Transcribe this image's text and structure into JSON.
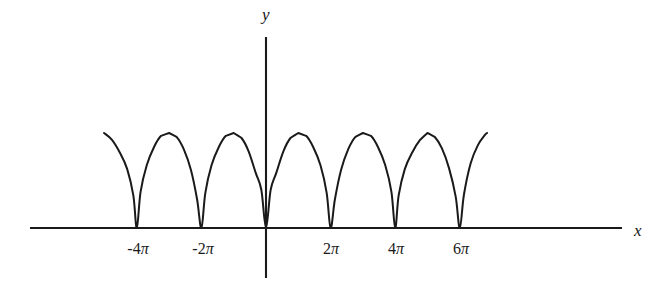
{
  "figure": {
    "background_color": "#ffffff",
    "curve_color": "#1a1a1a",
    "axis_color": "#1a1a1a",
    "width": 659,
    "height": 290
  },
  "axes": {
    "x_label": "x",
    "y_label": "y",
    "x_axis_pixel_y": 228,
    "y_axis_pixel_x": 266,
    "x_axis_start_px": 30,
    "x_axis_end_px": 622,
    "y_axis_top_px": 37,
    "y_axis_bottom_px": 278
  },
  "ticks": {
    "x": [
      {
        "label_num": "-4",
        "label_sym": "π",
        "value": -12.566370614,
        "pixel_x": 138
      },
      {
        "label_num": "-2",
        "label_sym": "π",
        "value": -6.283185307,
        "pixel_x": 203
      },
      {
        "label_num": "2",
        "label_sym": "π",
        "value": 6.283185307,
        "pixel_x": 331
      },
      {
        "label_num": "4",
        "label_sym": "π",
        "value": 12.566370614,
        "pixel_x": 396
      },
      {
        "label_num": "6",
        "label_sym": "π",
        "value": 18.849555922,
        "pixel_x": 461
      }
    ]
  },
  "chart_data": {
    "type": "line",
    "title": "",
    "xlabel": "x",
    "ylabel": "y",
    "grid": false,
    "legend": null,
    "function_description": "Periodic non-negative cusped wave: y = A*sqrt(|sin(x/2)|), period 2π, zeros at even multiples of π, sharp cusp maxima at odd multiples of π",
    "period": 6.283185307,
    "amplitude": 1.0,
    "xlim": [
      -16.0,
      21.5
    ],
    "ylim": [
      0,
      1.15
    ],
    "zeros": [
      -12.566370614,
      -6.283185307,
      0,
      6.283185307,
      12.566370614,
      18.849555922,
      25.132741229
    ],
    "peaks_x": [
      -15.707963268,
      -9.424777961,
      -3.141592654,
      3.141592654,
      9.424777961,
      15.707963268,
      21.991148575
    ],
    "peak_value": 1.0,
    "x": [
      -15.75,
      -15.0,
      -14.25,
      -13.5,
      -12.9,
      -12.566370614,
      -12.2,
      -11.6,
      -10.9,
      -10.2,
      -9.424777961,
      -8.7,
      -8.0,
      -7.3,
      -6.7,
      -6.283185307,
      -5.9,
      -5.3,
      -4.6,
      -3.9,
      -3.141592654,
      -2.4,
      -1.7,
      -1.0,
      -0.45,
      0,
      0.45,
      1.0,
      1.7,
      2.4,
      3.141592654,
      3.9,
      4.6,
      5.3,
      5.9,
      6.283185307,
      6.7,
      7.3,
      8.0,
      8.7,
      9.424777961,
      10.2,
      10.9,
      11.6,
      12.2,
      12.566370614,
      12.9,
      13.5,
      14.25,
      15.0,
      15.707963268,
      16.4,
      17.1,
      17.8,
      18.45,
      18.849555922,
      19.25,
      19.9,
      20.6,
      21.3,
      21.5
    ],
    "y": [
      1.0,
      0.93,
      0.8,
      0.62,
      0.34,
      0.0,
      0.38,
      0.66,
      0.85,
      0.97,
      1.0,
      0.96,
      0.83,
      0.61,
      0.3,
      0.0,
      0.37,
      0.66,
      0.85,
      0.97,
      1.0,
      0.95,
      0.81,
      0.58,
      0.4,
      0.0,
      0.4,
      0.58,
      0.81,
      0.95,
      1.0,
      0.97,
      0.85,
      0.66,
      0.37,
      0.0,
      0.3,
      0.61,
      0.83,
      0.96,
      1.0,
      0.97,
      0.85,
      0.66,
      0.38,
      0.0,
      0.34,
      0.62,
      0.8,
      0.93,
      1.0,
      0.96,
      0.84,
      0.63,
      0.33,
      0.0,
      0.35,
      0.68,
      0.87,
      0.98,
      1.0
    ]
  }
}
